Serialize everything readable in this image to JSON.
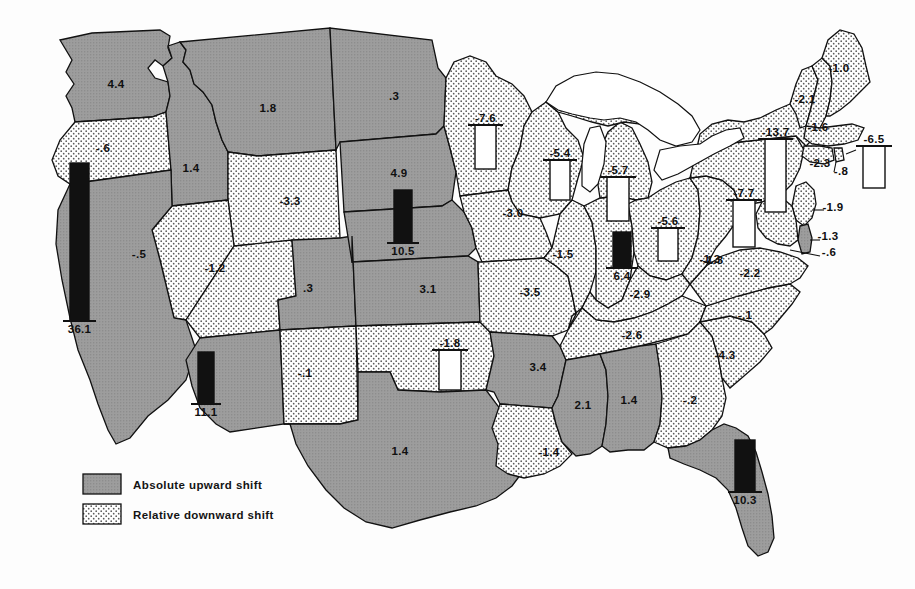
{
  "figure": {
    "kind": "choropleth-map-with-bars",
    "region": "United States"
  },
  "legend": {
    "items": [
      {
        "key": "absolute_upward",
        "label": "Absolute upward shift",
        "fill": "#9a9a9a",
        "pattern": "solid-gray"
      },
      {
        "key": "relative_downward",
        "label": "Relative downward shift",
        "fill": "#ffffff",
        "pattern": "stipple-dots"
      }
    ]
  },
  "colors": {
    "upward_fill": "#9a9a9a",
    "downward_fill": "#ffffff",
    "stipple_dot": "#4a4a4a",
    "outline": "#111111",
    "bar_filled": "#111111",
    "bar_hollow": "#ffffff",
    "water": "#ffffff"
  },
  "chart_data": {
    "type": "map",
    "title": "",
    "xlabel": "",
    "ylabel": "",
    "value_unit": "shift",
    "categories": [
      "Washington",
      "Oregon",
      "California",
      "Nevada",
      "Idaho",
      "Montana",
      "Wyoming",
      "Utah",
      "Arizona",
      "Colorado",
      "New Mexico",
      "North Dakota",
      "South Dakota",
      "Nebraska",
      "Kansas",
      "Oklahoma",
      "Texas",
      "Minnesota",
      "Iowa",
      "Missouri",
      "Arkansas",
      "Louisiana",
      "Wisconsin",
      "Illinois",
      "Michigan",
      "Indiana",
      "Ohio",
      "Kentucky",
      "Tennessee",
      "Mississippi",
      "Alabama",
      "Florida",
      "Georgia",
      "South Carolina",
      "North Carolina",
      "Virginia",
      "West Virginia",
      "Maryland",
      "Delaware",
      "Pennsylvania",
      "New Jersey",
      "New York",
      "Connecticut",
      "Rhode Island",
      "Massachusetts",
      "Vermont",
      "New Hampshire",
      "Maine"
    ],
    "values": [
      4.4,
      -0.6,
      36.1,
      -0.5,
      1.4,
      1.8,
      -3.3,
      -1.2,
      11.1,
      0.3,
      -0.1,
      0.3,
      4.9,
      10.5,
      3.1,
      -1.8,
      1.4,
      -7.6,
      -3.0,
      -3.5,
      3.4,
      -1.4,
      -5.4,
      6.4,
      -5.7,
      -1.5,
      -1.3,
      -2.9,
      -2.6,
      2.1,
      1.4,
      10.3,
      -0.2,
      -4.3,
      -0.1,
      -2.2,
      -1.3,
      -0.6,
      -1.3,
      -7.7,
      -1.9,
      -13.7,
      -2.3,
      -0.8,
      -6.5,
      -2.1,
      -1.6,
      -1.0
    ],
    "legend": [
      "Absolute upward shift",
      "Relative downward shift"
    ],
    "legend_position": "bottom-left",
    "grid": false
  },
  "states": [
    {
      "id": "WA",
      "name": "Washington",
      "label": "4.4",
      "x": 116,
      "y": 88,
      "shift": "up",
      "bar": null
    },
    {
      "id": "OR",
      "name": "Oregon",
      "label": "-.6",
      "x": 103,
      "y": 152,
      "shift": "down",
      "bar": null
    },
    {
      "id": "CA",
      "name": "California",
      "label": "",
      "x": 72,
      "y": 268,
      "shift": "up",
      "bar": {
        "kind": "filled",
        "value": "36.1",
        "x": 70,
        "y": 163,
        "w": 19,
        "h": 158,
        "cap": "bottom"
      }
    },
    {
      "id": "NV",
      "name": "Nevada",
      "label": "-.5",
      "x": 139,
      "y": 258,
      "shift": "down",
      "bar": null
    },
    {
      "id": "ID",
      "name": "Idaho",
      "label": "1.4",
      "x": 191,
      "y": 172,
      "shift": "up",
      "bar": null
    },
    {
      "id": "MT",
      "name": "Montana",
      "label": "1.8",
      "x": 268,
      "y": 112,
      "shift": "up",
      "bar": null
    },
    {
      "id": "WY",
      "name": "Wyoming",
      "label": "-3.3",
      "x": 290,
      "y": 205,
      "shift": "down",
      "bar": null
    },
    {
      "id": "UT",
      "name": "Utah",
      "label": "-1.2",
      "x": 215,
      "y": 272,
      "shift": "down",
      "bar": null
    },
    {
      "id": "AZ",
      "name": "Arizona",
      "label": "",
      "x": 205,
      "y": 330,
      "shift": "up",
      "bar": {
        "kind": "filled",
        "value": "11.1",
        "x": 198,
        "y": 352,
        "w": 16,
        "h": 52,
        "cap": "bottom"
      }
    },
    {
      "id": "CO",
      "name": "Colorado",
      "label": ".3",
      "x": 308,
      "y": 292,
      "shift": "up",
      "bar": null
    },
    {
      "id": "NM",
      "name": "New Mexico",
      "label": "-.1",
      "x": 305,
      "y": 377,
      "shift": "down",
      "bar": null
    },
    {
      "id": "ND",
      "name": "North Dakota",
      "label": ".3",
      "x": 394,
      "y": 100,
      "shift": "up",
      "bar": null
    },
    {
      "id": "SD",
      "name": "South Dakota",
      "label": "4.9",
      "x": 399,
      "y": 177,
      "shift": "up",
      "bar": null
    },
    {
      "id": "NE",
      "name": "Nebraska",
      "label": "",
      "x": 398,
      "y": 228,
      "shift": "up",
      "bar": {
        "kind": "filled",
        "value": "10.5",
        "x": 394,
        "y": 190,
        "w": 18,
        "h": 53,
        "cap": "bottom"
      }
    },
    {
      "id": "KS",
      "name": "Kansas",
      "label": "3.1",
      "x": 428,
      "y": 293,
      "shift": "up",
      "bar": null
    },
    {
      "id": "OK",
      "name": "Oklahoma",
      "label": "",
      "x": 447,
      "y": 370,
      "shift": "down",
      "bar": {
        "kind": "hollow",
        "value": "-1.8",
        "x": 439,
        "y": 350,
        "w": 22,
        "h": 40,
        "cap": "top"
      }
    },
    {
      "id": "TX",
      "name": "Texas",
      "label": "1.4",
      "x": 400,
      "y": 455,
      "shift": "up",
      "bar": null
    },
    {
      "id": "MN",
      "name": "Minnesota",
      "label": "",
      "x": 484,
      "y": 150,
      "shift": "down",
      "bar": {
        "kind": "hollow",
        "value": "-7.6",
        "x": 475,
        "y": 125,
        "w": 21,
        "h": 44,
        "cap": "top"
      }
    },
    {
      "id": "IA",
      "name": "Iowa",
      "label": "-3.0",
      "x": 513,
      "y": 217,
      "shift": "down",
      "bar": null
    },
    {
      "id": "MO",
      "name": "Missouri",
      "label": "-3.5",
      "x": 530,
      "y": 296,
      "shift": "down",
      "bar": null
    },
    {
      "id": "AR",
      "name": "Arkansas",
      "label": "3.4",
      "x": 538,
      "y": 371,
      "shift": "up",
      "bar": null
    },
    {
      "id": "LA",
      "name": "Louisiana",
      "label": "-1.4",
      "x": 549,
      "y": 456,
      "shift": "down",
      "bar": null
    },
    {
      "id": "WI",
      "name": "Wisconsin",
      "label": "",
      "x": 553,
      "y": 170,
      "shift": "down",
      "bar": {
        "kind": "hollow",
        "value": "-5.4",
        "x": 550,
        "y": 160,
        "w": 20,
        "h": 40,
        "cap": "top"
      }
    },
    {
      "id": "IL",
      "name": "Illinois",
      "label": "-1.5",
      "x": 563,
      "y": 258,
      "shift": "down",
      "bar": {
        "kind": "filled",
        "value": "6.4",
        "x": 613,
        "y": 232,
        "w": 18,
        "h": 36,
        "cap": "bottom"
      }
    },
    {
      "id": "MI",
      "name": "Michigan",
      "label": "",
      "x": 616,
      "y": 190,
      "shift": "down",
      "bar": {
        "kind": "hollow",
        "value": "-5.7",
        "x": 607,
        "y": 177,
        "w": 22,
        "h": 44,
        "cap": "top"
      }
    },
    {
      "id": "IN",
      "name": "Indiana",
      "label": "",
      "x": 600,
      "y": 245,
      "shift": "down",
      "bar": null
    },
    {
      "id": "OH",
      "name": "Ohio",
      "label": "",
      "x": 667,
      "y": 237,
      "shift": "down",
      "bar": {
        "kind": "hollow",
        "value": "-5.6",
        "x": 658,
        "y": 228,
        "w": 20,
        "h": 33,
        "cap": "top"
      }
    },
    {
      "id": "OH2",
      "name": "Ohio-label",
      "label": "-1.3",
      "x": 710,
      "y": 263,
      "shift": "down",
      "bar": null
    },
    {
      "id": "KY",
      "name": "Kentucky",
      "label": "-2.9",
      "x": 640,
      "y": 298,
      "shift": "down",
      "bar": null
    },
    {
      "id": "TN",
      "name": "Tennessee",
      "label": "-2.6",
      "x": 632,
      "y": 339,
      "shift": "down",
      "bar": null
    },
    {
      "id": "MS",
      "name": "Mississippi",
      "label": "2.1",
      "x": 583,
      "y": 409,
      "shift": "up",
      "bar": null
    },
    {
      "id": "AL",
      "name": "Alabama",
      "label": "1.4",
      "x": 629,
      "y": 404,
      "shift": "up",
      "bar": null
    },
    {
      "id": "FL",
      "name": "Florida",
      "label": "",
      "x": 742,
      "y": 490,
      "shift": "up",
      "bar": {
        "kind": "filled",
        "value": "10.3",
        "x": 735,
        "y": 440,
        "w": 20,
        "h": 52,
        "cap": "bottom"
      }
    },
    {
      "id": "GA",
      "name": "Georgia",
      "label": "-.2",
      "x": 690,
      "y": 404,
      "shift": "down",
      "bar": null
    },
    {
      "id": "SC",
      "name": "South Carolina",
      "label": "-4.3",
      "x": 725,
      "y": 359,
      "shift": "down",
      "bar": null
    },
    {
      "id": "NC",
      "name": "North Carolina",
      "label": "-.1",
      "x": 745,
      "y": 319,
      "shift": "down",
      "bar": null
    },
    {
      "id": "VA",
      "name": "Virginia",
      "label": "-2.2",
      "x": 750,
      "y": 277,
      "shift": "down",
      "bar": null
    },
    {
      "id": "WV",
      "name": "West Virginia",
      "label": "-1.3",
      "x": 713,
      "y": 264,
      "shift": "down",
      "bar": null
    },
    {
      "id": "MD",
      "name": "Maryland",
      "label": "-.6",
      "x": 829,
      "y": 256,
      "shift": "up",
      "bar": null
    },
    {
      "id": "DE",
      "name": "Delaware",
      "label": "-1.3",
      "x": 828,
      "y": 240,
      "shift": "down",
      "bar": null
    },
    {
      "id": "PA",
      "name": "Pennsylvania",
      "label": "",
      "x": 742,
      "y": 212,
      "shift": "down",
      "bar": {
        "kind": "hollow",
        "value": "-7.7",
        "x": 733,
        "y": 200,
        "w": 22,
        "h": 47,
        "cap": "top"
      }
    },
    {
      "id": "NJ",
      "name": "New Jersey",
      "label": "-1.9",
      "x": 833,
      "y": 211,
      "shift": "down",
      "bar": null
    },
    {
      "id": "NY",
      "name": "New York",
      "label": "",
      "x": 772,
      "y": 175,
      "shift": "down",
      "bar": {
        "kind": "hollow",
        "value": "-13.7",
        "x": 765,
        "y": 139,
        "w": 21,
        "h": 73,
        "cap": "top"
      }
    },
    {
      "id": "CT",
      "name": "Connecticut",
      "label": "-2.3",
      "x": 820,
      "y": 167,
      "shift": "down",
      "bar": null
    },
    {
      "id": "RI",
      "name": "Rhode Island",
      "label": "-.8",
      "x": 841,
      "y": 175,
      "shift": "down",
      "bar": null
    },
    {
      "id": "MA",
      "name": "Massachusetts",
      "label": "",
      "x": 872,
      "y": 160,
      "shift": "down",
      "bar": {
        "kind": "hollow",
        "value": "-6.5",
        "x": 863,
        "y": 146,
        "w": 22,
        "h": 42,
        "cap": "top"
      }
    },
    {
      "id": "VT",
      "name": "Vermont",
      "label": "-2.1",
      "x": 805,
      "y": 103,
      "shift": "down",
      "bar": null
    },
    {
      "id": "NH",
      "name": "New Hampshire",
      "label": "-1.6",
      "x": 818,
      "y": 131,
      "shift": "down",
      "bar": null
    },
    {
      "id": "ME",
      "name": "Maine",
      "label": "-1.0",
      "x": 839,
      "y": 72,
      "shift": "down",
      "bar": null
    }
  ]
}
